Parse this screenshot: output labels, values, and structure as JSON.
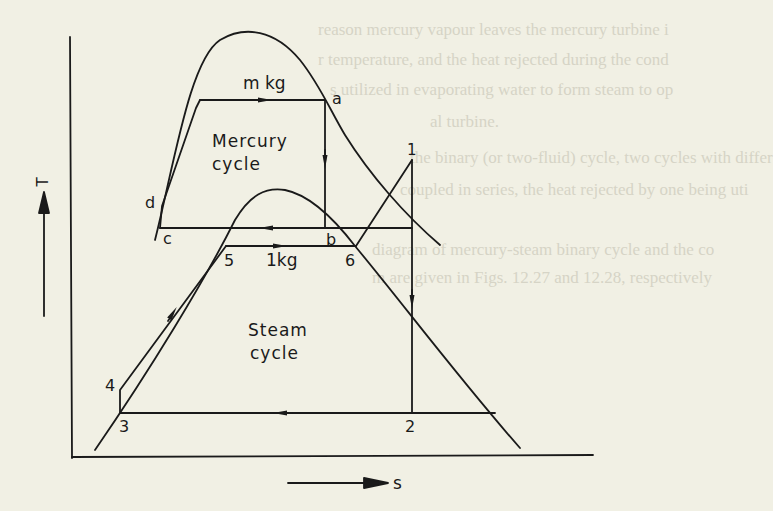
{
  "background_showthrough": {
    "lines": [
      "reason mercury vapour leaves the mercury turbine i",
      "r temperature, and the heat rejected during the cond",
      "s utilized in evaporating water to form steam to op",
      "al turbine.",
      "the binary (or two-fluid) cycle, two cycles with differ",
      "coupled in series, the heat rejected by one being uti",
      "diagram of mercury-steam binary cycle and the co",
      "m are given in Figs. 12.27 and 12.28, respectively"
    ]
  },
  "diagram": {
    "axes": {
      "y_label": "T",
      "x_label": "s"
    },
    "mercury_cycle": {
      "label_line1": "Mercury",
      "label_line2": "cycle",
      "mass_label": "m kg",
      "points": [
        "a",
        "b",
        "c",
        "d"
      ]
    },
    "steam_cycle": {
      "label_line1": "Steam",
      "label_line2": "cycle",
      "mass_label": "1kg",
      "points": [
        "1",
        "2",
        "3",
        "4",
        "5",
        "6"
      ]
    },
    "point_labels": {
      "a": "a",
      "b": "b",
      "c": "c",
      "d": "d",
      "p1": "1",
      "p2": "2",
      "p3": "3",
      "p4": "4",
      "p5": "5",
      "p6": "6"
    },
    "colors": {
      "ink": "#1a1a1a",
      "paper": "#f1f0e4",
      "showthrough": "#d6d4c6"
    }
  }
}
